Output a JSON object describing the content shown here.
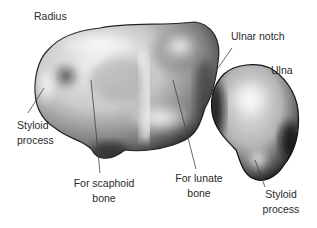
{
  "diagram": {
    "labels": {
      "radius": "Radius",
      "ulnar_notch": "Ulnar notch",
      "ulna": "Ulna",
      "radius_styloid_line1": "Styloid",
      "radius_styloid_line2": "process",
      "scaphoid_line1": "For scaphoid",
      "scaphoid_line2": "bone",
      "lunate_line1": "For lunate",
      "lunate_line2": "bone",
      "ulna_styloid_line1": "Styloid",
      "ulna_styloid_line2": "process"
    },
    "colors": {
      "background": "#ffffff",
      "text": "#2a2a2a",
      "bone_light": "#f4f4f4",
      "bone_mid": "#a8a8a8",
      "bone_dark": "#1e1e1e",
      "leader_line": "#444444"
    }
  }
}
